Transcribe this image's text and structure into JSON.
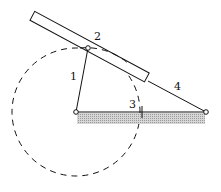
{
  "diagram": {
    "type": "mechanism",
    "labels": {
      "crank": "1",
      "slider": "2",
      "frame": "3",
      "rocker": "4"
    },
    "colors": {
      "stroke": "#111111",
      "ground_hatch": "#bdbdbd",
      "background": "#ffffff"
    }
  }
}
